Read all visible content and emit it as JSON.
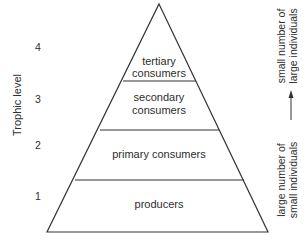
{
  "diagram": {
    "y_axis_label": "Trophic level",
    "levels": [
      {
        "number": "4",
        "label_lines": [
          "tertiary",
          "consumers"
        ]
      },
      {
        "number": "3",
        "label_lines": [
          "secondary",
          "consumers"
        ]
      },
      {
        "number": "2",
        "label_lines": [
          "primary consumers"
        ]
      },
      {
        "number": "1",
        "label_lines": [
          "producers"
        ]
      }
    ],
    "right_annotation": {
      "top_lines": [
        "small number of",
        "large individuals"
      ],
      "bottom_lines": [
        "large number of",
        "small individuals"
      ],
      "arrow_direction": "up"
    },
    "colors": {
      "stroke": "#333333",
      "text": "#2e2e2e",
      "background": "#ffffff"
    }
  }
}
